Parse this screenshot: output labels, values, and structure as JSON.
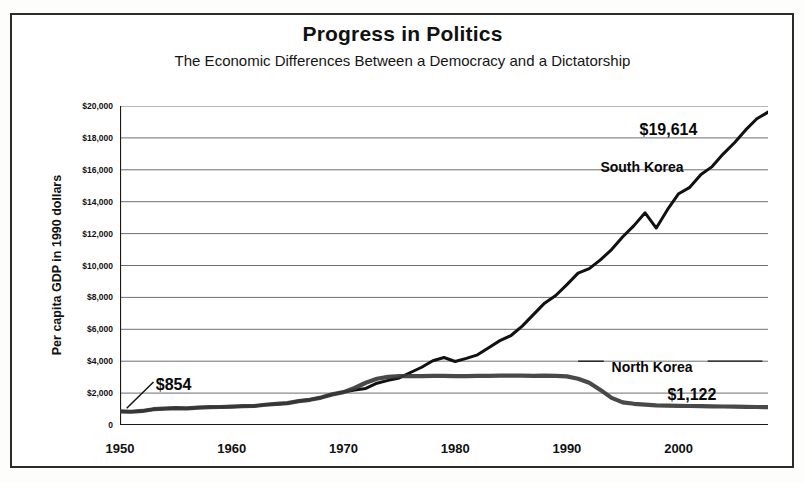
{
  "chart_data": {
    "type": "line",
    "title": "Progress in Politics",
    "subtitle": "The Economic Differences Between a Democracy and a Dictatorship",
    "xlabel": "",
    "ylabel": "Per capita GDP in 1990 dollars",
    "xlim": [
      1950,
      2008
    ],
    "ylim": [
      0,
      20000
    ],
    "grid": true,
    "legend_position": "inline-labels",
    "y_ticks": [
      0,
      2000,
      4000,
      6000,
      8000,
      10000,
      12000,
      14000,
      16000,
      18000,
      20000
    ],
    "y_tick_labels": [
      "0",
      "$2,000",
      "$4,000",
      "$6,000",
      "$8,000",
      "$10,000",
      "$12,000",
      "$14,000",
      "$16,000",
      "$18,000",
      "$20,000"
    ],
    "x_ticks": [
      1950,
      1960,
      1970,
      1980,
      1990,
      2000
    ],
    "x_tick_labels": [
      "1950",
      "1960",
      "1970",
      "1980",
      "1990",
      "2000"
    ],
    "x_minor_tick_interval": 1,
    "annotations": [
      {
        "name": "start-value",
        "text": "$854",
        "x": 1953.2,
        "y": 3100
      },
      {
        "name": "south-korea-end-value",
        "text": "$19,614",
        "x": 1996.5,
        "y": 19050
      },
      {
        "name": "south-korea-series-label",
        "text": "South Korea",
        "x": 1993.0,
        "y": 16650
      },
      {
        "name": "north-korea-series-label",
        "text": "North Korea",
        "x": 1994.0,
        "y": 4150
      },
      {
        "name": "north-korea-end-value",
        "text": "$1,122",
        "x": 1999.0,
        "y": 2450
      }
    ],
    "series": [
      {
        "name": "South Korea",
        "color": "#111111",
        "x": [
          1950,
          1951,
          1952,
          1953,
          1954,
          1955,
          1956,
          1957,
          1958,
          1959,
          1960,
          1961,
          1962,
          1963,
          1964,
          1965,
          1966,
          1967,
          1968,
          1969,
          1970,
          1971,
          1972,
          1973,
          1974,
          1975,
          1976,
          1977,
          1978,
          1979,
          1980,
          1981,
          1982,
          1983,
          1984,
          1985,
          1986,
          1987,
          1988,
          1989,
          1990,
          1991,
          1992,
          1993,
          1994,
          1995,
          1996,
          1997,
          1998,
          1999,
          2000,
          2001,
          2002,
          2003,
          2004,
          2005,
          2006,
          2007,
          2008
        ],
        "y": [
          854,
          830,
          880,
          990,
          1030,
          1060,
          1040,
          1090,
          1120,
          1130,
          1150,
          1180,
          1190,
          1270,
          1320,
          1370,
          1500,
          1580,
          1720,
          1920,
          2060,
          2200,
          2290,
          2620,
          2800,
          2950,
          3290,
          3620,
          4030,
          4230,
          3980,
          4180,
          4400,
          4840,
          5290,
          5610,
          6200,
          6920,
          7640,
          8120,
          8800,
          9520,
          9800,
          10350,
          11000,
          11800,
          12500,
          13300,
          12350,
          13500,
          14500,
          14900,
          15700,
          16200,
          17000,
          17700,
          18500,
          19200,
          19614
        ]
      },
      {
        "name": "North Korea",
        "color": "#3a3a3a",
        "x": [
          1950,
          1951,
          1952,
          1953,
          1954,
          1955,
          1956,
          1957,
          1958,
          1959,
          1960,
          1961,
          1962,
          1963,
          1964,
          1965,
          1966,
          1967,
          1968,
          1969,
          1970,
          1971,
          1972,
          1973,
          1974,
          1975,
          1976,
          1977,
          1978,
          1979,
          1980,
          1981,
          1982,
          1983,
          1984,
          1985,
          1986,
          1987,
          1988,
          1989,
          1990,
          1991,
          1992,
          1993,
          1994,
          1995,
          1996,
          1997,
          1998,
          1999,
          2000,
          2001,
          2002,
          2003,
          2004,
          2005,
          2006,
          2007,
          2008
        ],
        "y": [
          854,
          830,
          880,
          990,
          1030,
          1060,
          1040,
          1090,
          1120,
          1130,
          1150,
          1180,
          1190,
          1270,
          1320,
          1370,
          1500,
          1580,
          1720,
          1920,
          2060,
          2320,
          2650,
          2900,
          3020,
          3060,
          3070,
          3070,
          3080,
          3080,
          3060,
          3070,
          3080,
          3080,
          3090,
          3090,
          3090,
          3080,
          3090,
          3080,
          3050,
          2900,
          2650,
          2200,
          1700,
          1420,
          1330,
          1280,
          1230,
          1210,
          1200,
          1190,
          1180,
          1170,
          1160,
          1150,
          1140,
          1130,
          1122
        ]
      }
    ]
  }
}
